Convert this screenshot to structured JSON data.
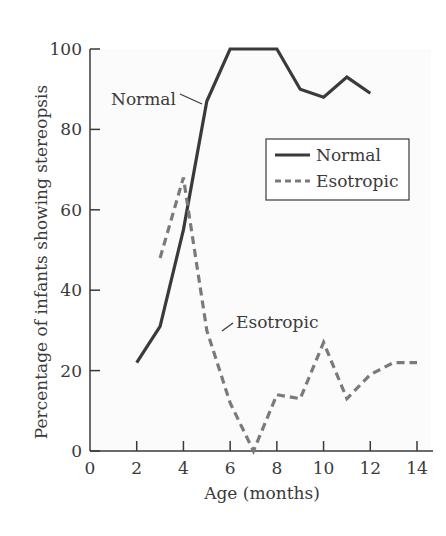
{
  "chart_data": {
    "type": "line",
    "title": "",
    "xlabel": "Age (months)",
    "ylabel": "Percentage of infants showing stereopsis",
    "xlim": [
      0,
      14
    ],
    "ylim": [
      0,
      100
    ],
    "xticks": [
      0,
      2,
      4,
      6,
      8,
      10,
      12,
      14
    ],
    "yticks": [
      0,
      20,
      40,
      60,
      80,
      100
    ],
    "grid": false,
    "legend_position": "upper right (inside plot)",
    "series": [
      {
        "name": "Normal",
        "style": "solid",
        "color": "#3a3a3a",
        "x": [
          2,
          3,
          4,
          5,
          6,
          7,
          8,
          9,
          10,
          11,
          12
        ],
        "values": [
          22,
          31,
          55,
          87,
          100,
          100,
          100,
          90,
          88,
          93,
          89
        ]
      },
      {
        "name": "Esotropic",
        "style": "dashed",
        "color": "#7a7a7a",
        "x": [
          3,
          4,
          5,
          6,
          7,
          8,
          9,
          10,
          11,
          12,
          13,
          14
        ],
        "values": [
          48,
          68,
          30,
          12,
          0,
          14,
          13,
          27,
          13,
          19,
          22,
          22
        ]
      }
    ],
    "annotations": [
      {
        "text": "Normal",
        "target_series": "Normal",
        "target_x": 5,
        "target_y": 87
      },
      {
        "text": "Esotropic",
        "target_series": "Esotropic",
        "target_x": 5,
        "target_y": 30
      }
    ]
  },
  "labels": {
    "xlabel": "Age (months)",
    "ylabel": "Percentage of infants showing stereopsis",
    "annot_normal": "Normal",
    "annot_esotropic": "Esotropic",
    "legend_normal": "Normal",
    "legend_esotropic": "Esotropic"
  }
}
